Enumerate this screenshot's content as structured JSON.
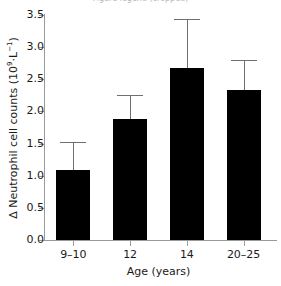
{
  "figure": {
    "cut_caption_sliver": "Figure legend (cropped)",
    "background_color": "#ffffff",
    "bar_color": "#000000",
    "errorbar_color": "#6f6f6f",
    "axis_color": "#9a9a9a"
  },
  "chart_data": {
    "type": "bar",
    "title": "",
    "xlabel": "Age (years)",
    "ylabel_plain": "Δ Neutrophil cell counts (10⁹·L⁻¹)",
    "ylabel_prefix": "Δ Neutrophil cell counts (10",
    "ylabel_exponent": "9",
    "ylabel_mid": "·L",
    "ylabel_exponent2": "−1",
    "ylabel_suffix": ")",
    "categories": [
      "9–10",
      "12",
      "14",
      "20–25"
    ],
    "values": [
      1.09,
      1.88,
      2.67,
      2.33
    ],
    "errors_upper": [
      1.53,
      2.26,
      3.44,
      2.8
    ],
    "error_magnitudes": [
      0.44,
      0.38,
      0.77,
      0.47
    ],
    "ylim": [
      0.0,
      3.5
    ],
    "yticks": [
      "0.0",
      "0.5",
      "1.0",
      "1.5",
      "2.0",
      "2.5",
      "3.0",
      "3.5"
    ],
    "ytick_values": [
      0.0,
      0.5,
      1.0,
      1.5,
      2.0,
      2.5,
      3.0,
      3.5
    ],
    "grid": false,
    "legend": null,
    "errorbar_direction": "upper-only"
  }
}
